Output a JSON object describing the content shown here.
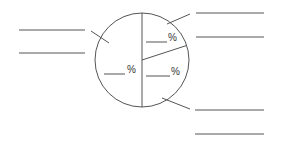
{
  "chart_data": {
    "type": "pie",
    "title": "",
    "slices": [
      {
        "label": "",
        "value": 50,
        "value_label": "%"
      },
      {
        "label": "",
        "value": 20,
        "value_label": "%"
      },
      {
        "label": "",
        "value": 30,
        "value_label": "%"
      }
    ],
    "note": "worksheet with blank label lines and blank percentage fields"
  },
  "labels": {
    "percent_sign": "%"
  }
}
